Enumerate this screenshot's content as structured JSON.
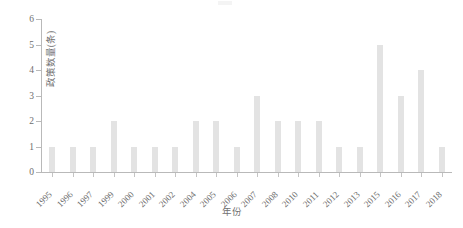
{
  "chart_data": {
    "type": "bar",
    "title": "",
    "xlabel": "年份",
    "ylabel": "政策数量(条)",
    "categories": [
      "1995",
      "1996",
      "1997",
      "1999",
      "2000",
      "2001",
      "2002",
      "2004",
      "2005",
      "2006",
      "2007",
      "2008",
      "2010",
      "2011",
      "2012",
      "2013",
      "2015",
      "2016",
      "2017",
      "2018"
    ],
    "values": [
      1,
      1,
      1,
      2,
      1,
      1,
      1,
      2,
      2,
      1,
      3,
      2,
      2,
      2,
      1,
      1,
      5,
      3,
      4,
      1
    ],
    "series": [
      {
        "name": "政策数量(条)",
        "values": [
          1,
          1,
          1,
          2,
          1,
          1,
          1,
          2,
          2,
          1,
          3,
          2,
          2,
          2,
          1,
          1,
          5,
          3,
          4,
          1
        ]
      }
    ],
    "ylim": [
      0,
      6
    ],
    "yticks": [
      0,
      1,
      2,
      3,
      4,
      5,
      6
    ],
    "ytick_labels": [
      "0",
      "1",
      "2",
      "3",
      "4",
      "5",
      "6"
    ],
    "grid": false,
    "legend": false,
    "legend_position": "none",
    "bar_color": "#e3e3e3",
    "axis_color": "#b9b9b9",
    "text_color": "#6e6e6e",
    "background_color": "#ffffff",
    "xtick_rotation": -45
  }
}
